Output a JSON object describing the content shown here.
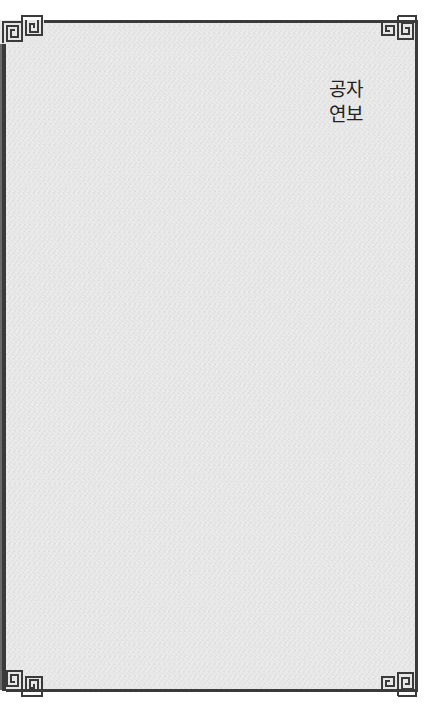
{
  "page": {
    "title_lines": [
      "공자",
      "연보"
    ],
    "decoration": {
      "frame_style": "meander-corner-border",
      "corner_icon": "greek-key-meander-icon"
    },
    "colors": {
      "paper": "#e6e6e6",
      "border": "#3a3a3a",
      "text": "#222222",
      "background": "#ffffff"
    }
  }
}
